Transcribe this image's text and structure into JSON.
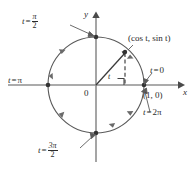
{
  "figure": {
    "kind": "unit-circle-diagram",
    "axes": {
      "x_label": "x",
      "y_label": "y",
      "origin_label": "0"
    },
    "colors": {
      "ink": "#2b2b2b",
      "axis": "#8a8a8a",
      "circle": "#555555",
      "background": "#ffffff"
    },
    "geometry": {
      "center_x": 96,
      "center_y": 85,
      "radius": 48,
      "point_x": 125,
      "point_y": 52
    },
    "labels": {
      "t_zero": {
        "lhs": "t",
        "eq": "=",
        "rhs": "0"
      },
      "t_pi": {
        "lhs": "t",
        "eq": "=",
        "rhs": "π"
      },
      "t_two_pi": {
        "lhs": "t",
        "eq": "=",
        "rhs": "2π"
      },
      "t_half_pi": {
        "lhs": "t",
        "eq": "=",
        "num": "π",
        "den": "2"
      },
      "t_three_half_pi": {
        "lhs": "t",
        "eq": "=",
        "num": "3π",
        "den": "2"
      },
      "point_coords": "(cos t, sin t)",
      "unit_point": "(1, 0)",
      "angle": "t"
    },
    "markers": {
      "right_angle": "right-angle-marker",
      "direction": "counterclockwise"
    }
  }
}
